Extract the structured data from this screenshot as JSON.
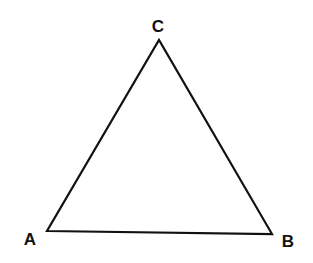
{
  "diagram": {
    "type": "triangle",
    "stroke_color": "#111111",
    "vertices": [
      {
        "label": "A",
        "x": 47,
        "y": 231,
        "label_x": 30,
        "label_y": 245
      },
      {
        "label": "B",
        "x": 272,
        "y": 234,
        "label_x": 287,
        "label_y": 247
      },
      {
        "label": "C",
        "x": 159,
        "y": 40,
        "label_x": 158,
        "label_y": 32
      }
    ]
  }
}
